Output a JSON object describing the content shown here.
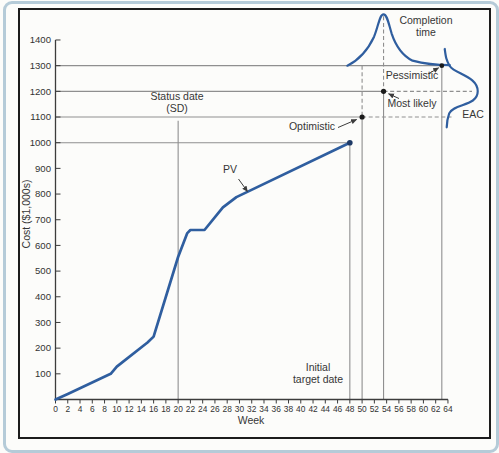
{
  "figure": {
    "background": "#fcfcfa",
    "outer_border_color": "#b5cbd8",
    "frame_color": "#1c1c1c"
  },
  "labels": {
    "status_date_line1": "Status date",
    "status_date_line2": "(SD)",
    "pv": "PV",
    "optimistic": "Optimistic",
    "most_likely": "Most likely",
    "pessimistic": "Pessimistic",
    "completion_time_line1": "Completion",
    "completion_time_line2": "time",
    "eac": "EAC",
    "initial_target_line1": "Initial",
    "initial_target_line2": "target date",
    "x_axis": "Week",
    "y_axis": "Cost ($1,000s)"
  },
  "chart_data": {
    "type": "line",
    "xlabel": "Week",
    "ylabel": "Cost ($1,000s)",
    "xlim": [
      0,
      64
    ],
    "ylim": [
      0,
      1400
    ],
    "grid": false,
    "x_ticks": [
      0,
      2,
      4,
      6,
      8,
      10,
      12,
      14,
      16,
      18,
      20,
      22,
      24,
      26,
      28,
      30,
      32,
      34,
      36,
      38,
      40,
      42,
      44,
      46,
      48,
      50,
      52,
      54,
      56,
      58,
      60,
      62,
      64
    ],
    "y_ticks": [
      100,
      200,
      300,
      400,
      500,
      600,
      700,
      800,
      900,
      1000,
      1100,
      1200,
      1300,
      1400
    ],
    "series": [
      {
        "name": "PV",
        "color": "#2f5e9f",
        "points": [
          [
            0,
            0
          ],
          [
            2,
            22
          ],
          [
            9,
            100
          ],
          [
            10,
            128
          ],
          [
            15,
            222
          ],
          [
            16,
            245
          ],
          [
            20,
            555
          ],
          [
            21.5,
            648
          ],
          [
            22,
            660
          ],
          [
            24.3,
            660
          ],
          [
            27.3,
            748
          ],
          [
            29.5,
            788
          ],
          [
            48,
            1000
          ]
        ]
      }
    ],
    "annotations": {
      "status_date": {
        "label": "Status date (SD)",
        "week": 20,
        "line_top_cost": 1085
      },
      "initial_target_date": {
        "label": "Initial target date",
        "week": 48
      },
      "pv_end": {
        "week": 48,
        "cost": 1000
      },
      "optimistic": {
        "label": "Optimistic",
        "week": 50,
        "cost": 1100
      },
      "most_likely": {
        "label": "Most likely",
        "week": 53.5,
        "cost": 1200
      },
      "pessimistic": {
        "label": "Pessimistic",
        "week": 63,
        "cost": 1300
      },
      "completion_time_distribution": {
        "label": "Completion time",
        "baseline_cost": 1300,
        "start_week": 47.6,
        "peak_week": 53.5,
        "peak_cost": 1500,
        "end_week": 64.3,
        "skew": "right"
      },
      "eac_distribution": {
        "label": "EAC",
        "baseline_week": 63.8,
        "top_cost": 1365,
        "mode_cost": 1200,
        "bottom_cost": 1060
      }
    },
    "styles": {
      "guide_color": "#8f8f8f",
      "dash_pattern": "4 2.6",
      "curve_color": "#2f5e9f",
      "dot_color": "#1b1b1b",
      "pv_dot_color": "#1e3a66",
      "axis_color": "#3c3c3c",
      "arrow_color": "#3c3c3c",
      "tick_text_color": "#333333"
    }
  }
}
